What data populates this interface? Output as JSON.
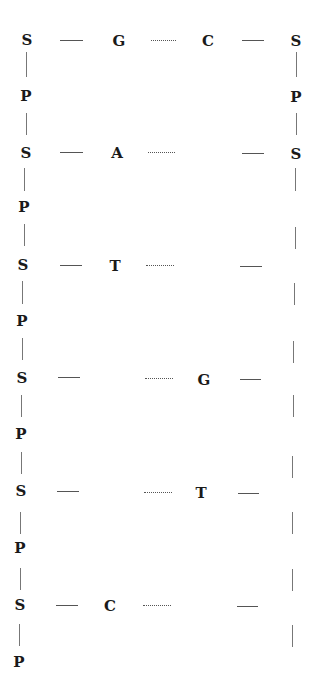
{
  "diagram": {
    "left_strand": [
      "S",
      "P",
      "S",
      "P",
      "S",
      "P",
      "S",
      "P",
      "S",
      "P",
      "S",
      "P"
    ],
    "right_strand_labels": [
      "S",
      "P",
      "S"
    ],
    "rows": [
      {
        "left_sugar": "S",
        "left_base": "G",
        "right_base": "C",
        "right_sugar": "S"
      },
      {
        "left_sugar": "S",
        "left_base": "A",
        "right_base": "",
        "right_sugar": "S"
      },
      {
        "left_sugar": "S",
        "left_base": "T",
        "right_base": "",
        "right_sugar": ""
      },
      {
        "left_sugar": "S",
        "left_base": "",
        "right_base": "G",
        "right_sugar": ""
      },
      {
        "left_sugar": "S",
        "left_base": "",
        "right_base": "T",
        "right_sugar": ""
      },
      {
        "left_sugar": "S",
        "left_base": "C",
        "right_base": "",
        "right_sugar": ""
      }
    ],
    "phosphates_left": [
      "P",
      "P",
      "P",
      "P",
      "P",
      "P"
    ],
    "phosphate_right": "P"
  }
}
